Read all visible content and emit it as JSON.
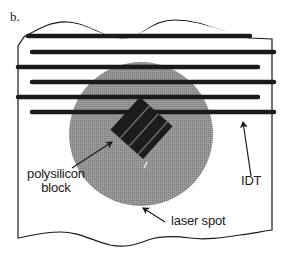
{
  "figure": {
    "panel_label": "b.",
    "labels": {
      "polysilicon_line1": "polysilicon",
      "polysilicon_line2": "block",
      "laser_spot": "laser spot",
      "idt": "IDT"
    },
    "colors": {
      "ink": "#1a1a1a",
      "laser_spot_fill": "#8f8f8f",
      "block_fill": "#1c1c1c",
      "block_stripe": "#6a6a6a",
      "background": "#ffffff"
    },
    "idt_fingers": [
      {
        "y": 36,
        "x1": 28,
        "x2": 250
      },
      {
        "y": 52,
        "x1": 32,
        "x2": 274
      },
      {
        "y": 67,
        "x1": 18,
        "x2": 258
      },
      {
        "y": 82,
        "x1": 32,
        "x2": 274
      },
      {
        "y": 97,
        "x1": 18,
        "x2": 258
      },
      {
        "y": 112,
        "x1": 32,
        "x2": 274
      }
    ]
  }
}
